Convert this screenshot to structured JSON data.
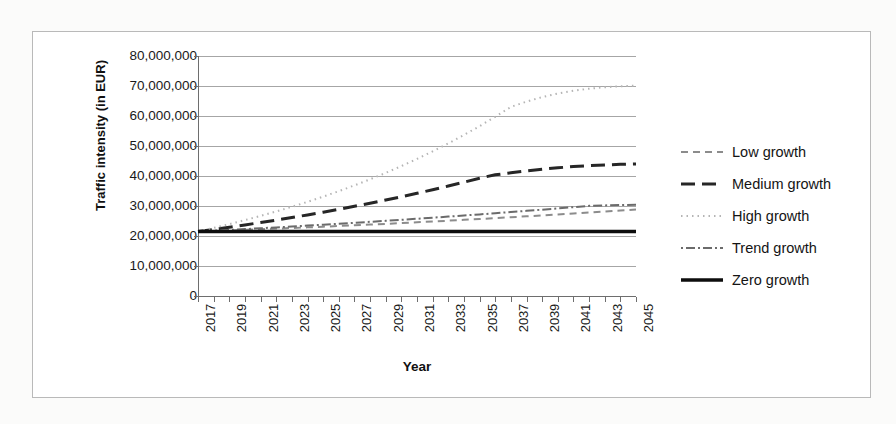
{
  "chart_data": {
    "type": "line",
    "title": "",
    "xlabel": "Year",
    "ylabel": "Traffic intensity (in EUR)",
    "ylim": [
      0,
      80000000
    ],
    "y_ticks": [
      {
        "value": 80000000,
        "label": "80,000,000"
      },
      {
        "value": 70000000,
        "label": "70,000,000"
      },
      {
        "value": 60000000,
        "label": "60,000,000"
      },
      {
        "value": 50000000,
        "label": "50,000,000"
      },
      {
        "value": 40000000,
        "label": "40,000,000"
      },
      {
        "value": 30000000,
        "label": "30,000,000"
      },
      {
        "value": 20000000,
        "label": "20,000,000"
      },
      {
        "value": 10000000,
        "label": "10,000,000"
      },
      {
        "value": 0,
        "label": "0"
      }
    ],
    "grid": true,
    "legend_position": "right",
    "xlim": [
      2017,
      2045
    ],
    "x": [
      2017,
      2018,
      2019,
      2020,
      2021,
      2022,
      2023,
      2024,
      2025,
      2026,
      2027,
      2028,
      2029,
      2030,
      2031,
      2032,
      2033,
      2034,
      2035,
      2036,
      2037,
      2038,
      2039,
      2040,
      2041,
      2042,
      2043,
      2044,
      2045
    ],
    "x_tick_labels": [
      "2017",
      "2019",
      "2021",
      "2023",
      "2025",
      "2027",
      "2029",
      "2031",
      "2033",
      "2035",
      "2037",
      "2039",
      "2041",
      "2043",
      "2045"
    ],
    "series": [
      {
        "name": "Low growth",
        "style": "dashed",
        "color": "#8c8c8c",
        "width": 2,
        "dash": "7,5",
        "values": [
          21500000,
          21680000,
          21870000,
          22060000,
          22260000,
          22460000,
          22670000,
          22880000,
          23100000,
          23330000,
          23560000,
          23800000,
          24050000,
          24300000,
          24560000,
          24830000,
          25100000,
          25380000,
          25670000,
          25960000,
          26260000,
          26560000,
          26870000,
          27180000,
          27500000,
          27820000,
          28150000,
          28480000,
          28820000
        ]
      },
      {
        "name": "Medium growth",
        "style": "long-dashed",
        "color": "#262626",
        "width": 3,
        "dash": "14,7",
        "values": [
          21500000,
          22200000,
          22930000,
          23690000,
          24480000,
          25300000,
          26150000,
          27030000,
          27950000,
          28900000,
          29890000,
          30910000,
          31980000,
          33080000,
          34230000,
          35420000,
          36660000,
          37940000,
          39270000,
          40400000,
          41060000,
          41700000,
          42260000,
          42740000,
          43140000,
          43460000,
          43700000,
          43880000,
          44000000
        ]
      },
      {
        "name": "High growth",
        "style": "dotted",
        "color": "#b5b5b5",
        "width": 2,
        "dash": "1.5,4",
        "values": [
          21500000,
          22700000,
          23960000,
          25300000,
          26700000,
          28180000,
          29740000,
          31380000,
          33110000,
          34940000,
          36870000,
          38900000,
          41040000,
          43300000,
          45690000,
          48210000,
          50860000,
          53660000,
          56620000,
          59730000,
          63020000,
          64800000,
          66300000,
          67500000,
          68400000,
          69100000,
          69600000,
          69900000,
          70100000
        ]
      },
      {
        "name": "Trend growth",
        "style": "dash-dot",
        "color": "#6b6b6b",
        "width": 2,
        "dash": "2,3,9,3",
        "values": [
          21500000,
          21760000,
          22030000,
          22300000,
          22580000,
          22870000,
          23160000,
          23460000,
          23770000,
          24080000,
          24400000,
          24720000,
          25060000,
          25400000,
          25750000,
          26100000,
          26460000,
          26830000,
          27200000,
          27590000,
          27980000,
          28380000,
          28780000,
          29200000,
          29620000,
          30050000,
          30200000,
          30320000,
          30400000
        ]
      },
      {
        "name": "Zero growth",
        "style": "solid",
        "color": "#0d0d0d",
        "width": 3.4,
        "dash": "",
        "values": [
          21500000,
          21500000,
          21500000,
          21500000,
          21500000,
          21500000,
          21500000,
          21500000,
          21500000,
          21500000,
          21500000,
          21500000,
          21500000,
          21500000,
          21500000,
          21500000,
          21500000,
          21500000,
          21500000,
          21500000,
          21500000,
          21500000,
          21500000,
          21500000,
          21500000,
          21500000,
          21500000,
          21500000,
          21500000
        ]
      }
    ]
  }
}
